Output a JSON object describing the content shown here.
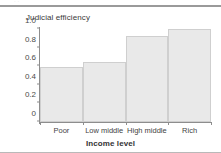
{
  "figure": {
    "caption_remnant": "· ·",
    "background_color": "#ffffff",
    "rule_color": "#9a9a9a"
  },
  "chart_data": {
    "type": "bar",
    "title": "Judicial efficiency",
    "xlabel": "Income level",
    "ylabel": "",
    "categories": [
      "Poor",
      "Low middle",
      "High middle",
      "Rich"
    ],
    "values": [
      0.59,
      0.64,
      0.93,
      1.0
    ],
    "ylim": [
      0,
      1.0
    ],
    "yticks": [
      0,
      0.2,
      0.4,
      0.6,
      0.8,
      1.0
    ],
    "ytick_labels": [
      "0",
      "0.2",
      "0.4",
      "0.6",
      "0.8",
      "1.0"
    ],
    "grid": false,
    "legend": null,
    "bar_fill_color": "#e9e9e9",
    "bar_edge_color": "#cfcfcf",
    "axis_color": "#8d8d8d"
  }
}
